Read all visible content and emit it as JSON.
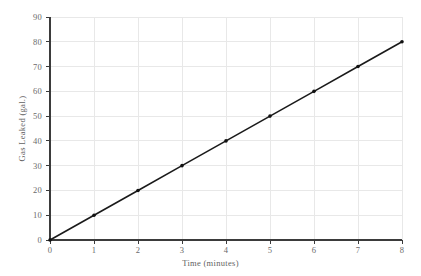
{
  "chart_data": {
    "type": "line",
    "title": "",
    "xlabel": "Time (minutes)",
    "ylabel": "Gas Leaked (gal.)",
    "x": [
      0,
      1,
      2,
      3,
      4,
      5,
      6,
      7,
      8
    ],
    "values": [
      0,
      10,
      20,
      30,
      40,
      50,
      60,
      70,
      80
    ],
    "series": [
      {
        "name": "Gas Leaked",
        "x": [
          0,
          1,
          2,
          3,
          4,
          5,
          6,
          7,
          8
        ],
        "values": [
          0,
          10,
          20,
          30,
          40,
          50,
          60,
          70,
          80
        ]
      }
    ],
    "xlim": [
      0,
      8
    ],
    "ylim": [
      0,
      90
    ],
    "xticks": [
      0,
      1,
      2,
      3,
      4,
      5,
      6,
      7,
      8
    ],
    "yticks": [
      0,
      10,
      20,
      30,
      40,
      50,
      60,
      70,
      80,
      90
    ],
    "xtick_labels": [
      "0",
      "1",
      "2",
      "3",
      "4",
      "5",
      "6",
      "7",
      "8"
    ],
    "ytick_labels": [
      "0",
      "10",
      "20",
      "30",
      "40",
      "50",
      "60",
      "70",
      "80",
      "90"
    ],
    "grid": true,
    "legend": false,
    "legend_position": "none",
    "slope": 10,
    "markers": true,
    "colors": {
      "line": "#1a1a1a",
      "marker": "#111111",
      "grid": "#e8e8e8",
      "axis": "#3b3b3b",
      "tick_label": "#6a6a6a",
      "axis_label": "#5f5f5f",
      "background": "#ffffff"
    }
  }
}
